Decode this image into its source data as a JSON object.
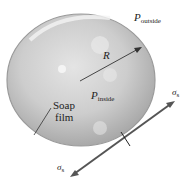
{
  "diagram": {
    "labels": {
      "p_outside": {
        "main": "P",
        "sub": "outside"
      },
      "p_inside": {
        "main": "P",
        "sub": "inside"
      },
      "radius": "R",
      "soap_film_line1": "Soap",
      "soap_film_line2": "film",
      "sigma_top": {
        "main": "σ",
        "sub": "s"
      },
      "sigma_bottom": {
        "main": "σ",
        "sub": "s"
      }
    },
    "colors": {
      "bubble_fill": "#c8c8c8",
      "bubble_edge": "#9a9a9a",
      "arrow": "#555555",
      "text": "#222222"
    }
  }
}
